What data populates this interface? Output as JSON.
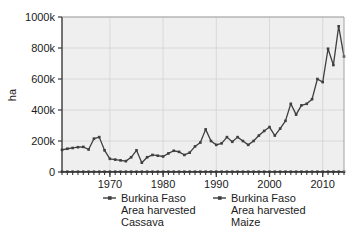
{
  "chart_data": {
    "type": "line",
    "title": "",
    "subtitle": "",
    "xlabel": "",
    "ylabel": "ha",
    "xlim": [
      1961,
      2014
    ],
    "ylim": [
      0,
      1000000
    ],
    "grid": true,
    "legend_position": "bottom",
    "y_ticks": [
      0,
      200000,
      400000,
      600000,
      800000,
      1000000
    ],
    "y_tick_labels": [
      "0",
      "200k",
      "400k",
      "600k",
      "800k",
      "1000k"
    ],
    "x_ticks": [
      1970,
      1980,
      1990,
      2000,
      2010
    ],
    "x_tick_labels": [
      "1970",
      "1980",
      "1990",
      "2000",
      "2010"
    ],
    "x_minor_tick_step": 1,
    "x": [
      1961,
      1962,
      1963,
      1964,
      1965,
      1966,
      1967,
      1968,
      1969,
      1970,
      1971,
      1972,
      1973,
      1974,
      1975,
      1976,
      1977,
      1978,
      1979,
      1980,
      1981,
      1982,
      1983,
      1984,
      1985,
      1986,
      1987,
      1988,
      1989,
      1990,
      1991,
      1992,
      1993,
      1994,
      1995,
      1996,
      1997,
      1998,
      1999,
      2000,
      2001,
      2002,
      2003,
      2004,
      2005,
      2006,
      2007,
      2008,
      2009,
      2010,
      2011,
      2012,
      2013,
      2014
    ],
    "series": [
      {
        "name": "Burkina Faso Area harvested Cassava",
        "color": "#3f3f3f",
        "marker": "dot",
        "values": [
          2000,
          2000,
          2000,
          2000,
          2000,
          2000,
          2000,
          2000,
          2000,
          2000,
          2000,
          2000,
          2000,
          2000,
          2000,
          2000,
          2000,
          2000,
          2000,
          2000,
          2000,
          2000,
          2000,
          2000,
          2000,
          2000,
          2000,
          2000,
          2000,
          2000,
          2000,
          2000,
          2000,
          2000,
          2000,
          2000,
          2000,
          2000,
          2000,
          2000,
          2000,
          2000,
          2000,
          2000,
          2000,
          2000,
          2000,
          2000,
          2000,
          2000,
          2000,
          2000,
          2000,
          2000
        ]
      },
      {
        "name": "Burkina Faso Area harvested Maize",
        "color": "#3f3f3f",
        "marker": "dot",
        "values": [
          143000,
          150000,
          155000,
          160000,
          162000,
          145000,
          215000,
          225000,
          140000,
          85000,
          80000,
          75000,
          70000,
          95000,
          140000,
          60000,
          95000,
          110000,
          105000,
          100000,
          120000,
          137000,
          130000,
          110000,
          125000,
          165000,
          190000,
          275000,
          200000,
          175000,
          185000,
          225000,
          195000,
          225000,
          200000,
          175000,
          200000,
          235000,
          265000,
          290000,
          235000,
          280000,
          330000,
          440000,
          370000,
          430000,
          440000,
          470000,
          600000,
          580000,
          795000,
          690000,
          940000,
          745000
        ]
      }
    ]
  },
  "legend": {
    "items": [
      {
        "line1": "Burkina Faso",
        "line2": "Area harvested",
        "line3": "Cassava"
      },
      {
        "line1": "Burkina Faso",
        "line2": "Area harvested",
        "line3": "Maize"
      }
    ]
  }
}
